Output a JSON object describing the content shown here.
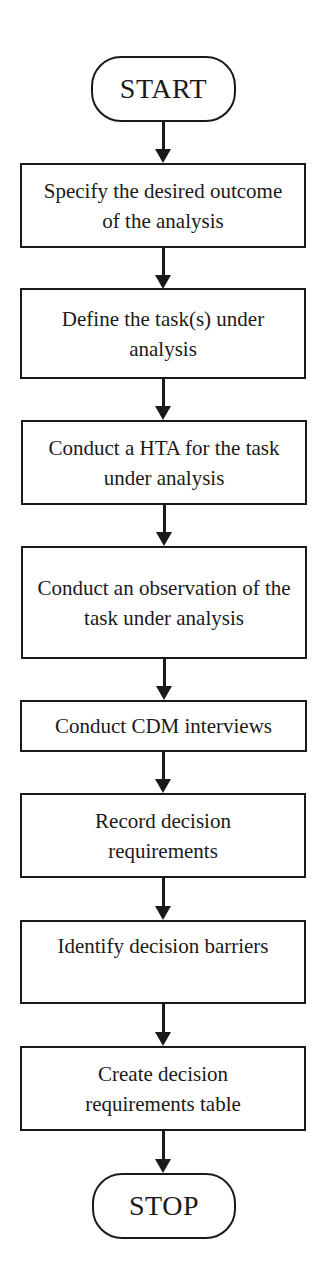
{
  "flowchart": {
    "start": {
      "label": "START"
    },
    "steps": [
      {
        "label": "Specify the desired outcome of the analysis"
      },
      {
        "label": "Define the task(s) under analysis"
      },
      {
        "label": "Conduct a HTA for the task under analysis"
      },
      {
        "label": "Conduct an observation of the task under analysis"
      },
      {
        "label": "Conduct CDM interviews"
      },
      {
        "label": "Record decision requirements"
      },
      {
        "label": "Identify decision barriers"
      },
      {
        "label": "Create decision requirements table"
      }
    ],
    "stop": {
      "label": "STOP"
    }
  },
  "colors": {
    "stroke": "#1a1a1a",
    "background": "#ffffff"
  }
}
